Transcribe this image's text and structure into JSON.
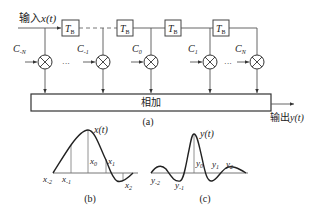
{
  "panel_a": {
    "input_label_cn": "输入",
    "input_label_sym": "x(t)",
    "delay_label_main": "T",
    "delay_label_sub": "B",
    "coefficients": [
      {
        "main": "C",
        "sub": "-N"
      },
      {
        "main": "C",
        "sub": "-1"
      },
      {
        "main": "C",
        "sub": "0"
      },
      {
        "main": "C",
        "sub": "1"
      },
      {
        "main": "C",
        "sub": "N"
      }
    ],
    "ellipsis": "···",
    "sum_label": "相加",
    "output_label_cn": "输出",
    "output_label_sym": "y(t)",
    "caption": "(a)"
  },
  "panel_b": {
    "curve_label": "x(t)",
    "samples": [
      {
        "main": "x",
        "sub": "-2"
      },
      {
        "main": "x",
        "sub": "-1"
      },
      {
        "main": "x",
        "sub": "0"
      },
      {
        "main": "x",
        "sub": "1"
      },
      {
        "main": "x",
        "sub": "2"
      }
    ],
    "caption": "(b)"
  },
  "panel_c": {
    "curve_label": "y(t)",
    "samples": [
      {
        "main": "y",
        "sub": "-2"
      },
      {
        "main": "y",
        "sub": "-1"
      },
      {
        "main": "y",
        "sub": "0"
      },
      {
        "main": "y",
        "sub": "1"
      },
      {
        "main": "y",
        "sub": "2"
      }
    ],
    "caption": "(c)"
  }
}
